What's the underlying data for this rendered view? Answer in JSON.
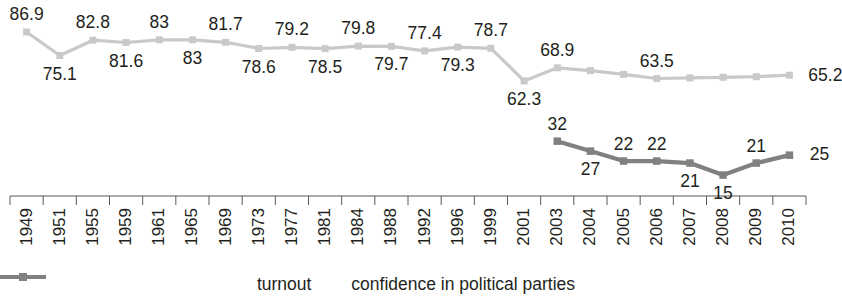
{
  "chart_data": {
    "type": "line",
    "title": "",
    "xlabel": "",
    "ylabel": "",
    "grid": false,
    "legend_position": "bottom",
    "ylim": [
      0,
      100
    ],
    "categories": [
      "1949",
      "1951",
      "1955",
      "1959",
      "1961",
      "1965",
      "1969",
      "1973",
      "1977",
      "1981",
      "1984",
      "1988",
      "1992",
      "1996",
      "1999",
      "2001",
      "2003",
      "2004",
      "2005",
      "2006",
      "2007",
      "2008",
      "2009",
      "2010"
    ],
    "series": [
      {
        "name": "turnout",
        "color": "#c9c9c9",
        "values": [
          86.9,
          75.1,
          82.8,
          81.6,
          83,
          83,
          81.7,
          78.6,
          79.2,
          78.5,
          79.8,
          79.7,
          77.4,
          79.3,
          78.7,
          62.3,
          68.9,
          67.5,
          65.6,
          63.5,
          63.8,
          64.1,
          64.4,
          65.2
        ],
        "labels": [
          "86.9",
          "75.1",
          "82.8",
          "81.6",
          "83",
          "83",
          "81.7",
          "78.6",
          "79.2",
          "78.5",
          "79.8",
          "79.7",
          "77.4",
          "79.3",
          "78.7",
          "62.3",
          "68.9",
          "",
          "",
          "63.5",
          "",
          "",
          "",
          "65.2"
        ]
      },
      {
        "name": "confidence in political parties",
        "color": "#808080",
        "values": [
          null,
          null,
          null,
          null,
          null,
          null,
          null,
          null,
          null,
          null,
          null,
          null,
          null,
          null,
          null,
          null,
          32,
          27,
          22,
          22,
          21,
          15,
          21,
          25
        ],
        "labels": [
          "",
          "",
          "",
          "",
          "",
          "",
          "",
          "",
          "",
          "",
          "",
          "",
          "",
          "",
          "",
          "",
          "32",
          "27",
          "22",
          "22",
          "21",
          "15",
          "21",
          "25"
        ]
      }
    ]
  },
  "legend": {
    "items": [
      {
        "label": "turnout",
        "color": "#c9c9c9"
      },
      {
        "label": "confidence in political parties",
        "color": "#808080"
      }
    ]
  }
}
